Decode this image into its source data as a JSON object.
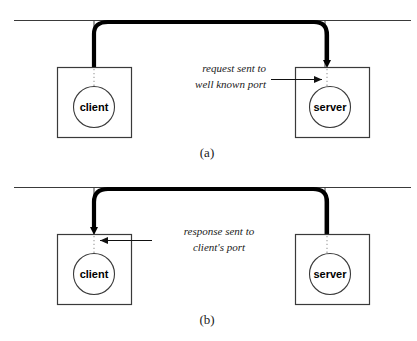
{
  "figure": {
    "colors": {
      "line": "#3a3a3a",
      "thick_flow": "#000000",
      "box_stroke": "#3a3a3a",
      "circle_stroke": "#3a3a3a",
      "dotted_port": "#9a9a9a",
      "text": "#1a1a1a",
      "background": "#ffffff"
    },
    "panels": [
      {
        "id": "panel-a",
        "caption": "(a)",
        "annotation_lines": [
          "request sent to",
          "well known port"
        ],
        "annotation_align": "right",
        "flow_from": "client",
        "flow_to": "server",
        "pointer_direction": "right",
        "nodes": [
          {
            "id": "client",
            "label": "client",
            "side": "left"
          },
          {
            "id": "server",
            "label": "server",
            "side": "right"
          }
        ]
      },
      {
        "id": "panel-b",
        "caption": "(b)",
        "annotation_lines": [
          "response sent to",
          "client's port"
        ],
        "annotation_align": "center",
        "flow_from": "server",
        "flow_to": "client",
        "pointer_direction": "left",
        "nodes": [
          {
            "id": "client",
            "label": "client",
            "side": "left"
          },
          {
            "id": "server",
            "label": "server",
            "side": "right"
          }
        ]
      }
    ]
  }
}
